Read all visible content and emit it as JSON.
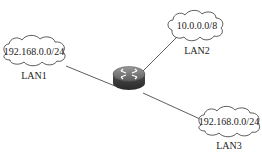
{
  "diagram": {
    "router": {
      "name": "Router",
      "icon": "router-icon"
    },
    "networks": [
      {
        "id": "lan1",
        "subnet": "192.168.0.0/24",
        "label": "LAN1"
      },
      {
        "id": "lan2",
        "subnet": "10.0.0.0/8",
        "label": "LAN2"
      },
      {
        "id": "lan3",
        "subnet": "192.168.0.0/24",
        "label": "LAN3"
      }
    ],
    "links": [
      {
        "from": "router",
        "to": "lan1"
      },
      {
        "from": "router",
        "to": "lan2"
      },
      {
        "from": "router",
        "to": "lan3"
      }
    ]
  }
}
